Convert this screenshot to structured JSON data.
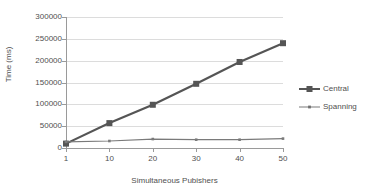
{
  "chart_data": {
    "type": "line",
    "title": "",
    "xlabel": "Simultaneous Pubishers",
    "ylabel": "Time (ms)",
    "categories": [
      "1",
      "10",
      "20",
      "30",
      "40",
      "50"
    ],
    "x": [
      1,
      10,
      20,
      30,
      40,
      50
    ],
    "ylim": [
      0,
      300000
    ],
    "xlim_categorical": true,
    "yticks": [
      0,
      50000,
      100000,
      150000,
      200000,
      250000,
      300000
    ],
    "ytick_labels": [
      "0",
      "50000",
      "100000",
      "150000",
      "200000",
      "250000",
      "300000"
    ],
    "xtick_labels": [
      "1",
      "10",
      "20",
      "30",
      "40",
      "50"
    ],
    "grid": "horizontal",
    "legend_position": "right",
    "series": [
      {
        "name": "Central",
        "values": [
          10000,
          57000,
          99000,
          147000,
          197000,
          240000
        ],
        "color": "#555555",
        "marker": "square",
        "marker_size": 6,
        "line_width": 2.2
      },
      {
        "name": "Spanning",
        "values": [
          14000,
          16000,
          20500,
          19000,
          19000,
          21500
        ],
        "color": "#7a7a7a",
        "marker": "square",
        "marker_size": 2.6,
        "line_width": 1.2
      }
    ]
  },
  "colors": {
    "background": "#ffffff",
    "axis": "#9a9a9a",
    "gridline": "#dcdcdc",
    "text": "#4f4f4f",
    "central": "#555555",
    "spanning": "#7a7a7a"
  },
  "legend": {
    "items": [
      {
        "label": "Central"
      },
      {
        "label": "Spanning"
      }
    ]
  }
}
